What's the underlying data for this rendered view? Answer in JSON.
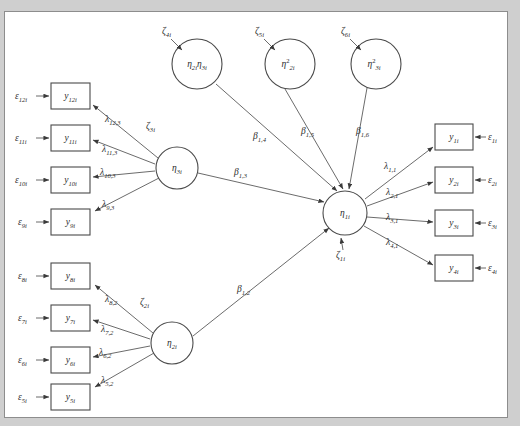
{
  "figure": {
    "type": "sem-path-diagram",
    "background_color": "#cfcfcf",
    "panel_color": "#ffffff",
    "border_color": "#8d8d8d",
    "line_color": "#5a5a5a"
  },
  "indicators_left": [
    {
      "id": "y12",
      "box_label": "y",
      "box_sub": "12i",
      "error_label": "ε",
      "error_sub": "12i",
      "loading_base": "λ",
      "loading_sub": "12,3"
    },
    {
      "id": "y11",
      "box_label": "y",
      "box_sub": "11i",
      "error_label": "ε",
      "error_sub": "11i",
      "loading_base": "λ",
      "loading_sub": "11,3"
    },
    {
      "id": "y10",
      "box_label": "y",
      "box_sub": "10i",
      "error_label": "ε",
      "error_sub": "10i",
      "loading_base": "λ",
      "loading_sub": "10,3"
    },
    {
      "id": "y9",
      "box_label": "y",
      "box_sub": "9i",
      "error_label": "ε",
      "error_sub": "9i",
      "loading_base": "λ",
      "loading_sub": "9,3"
    },
    {
      "id": "y8",
      "box_label": "y",
      "box_sub": "8i",
      "error_label": "ε",
      "error_sub": "8i",
      "loading_base": "λ",
      "loading_sub": "8,2"
    },
    {
      "id": "y7",
      "box_label": "y",
      "box_sub": "7i",
      "error_label": "ε",
      "error_sub": "7i",
      "loading_base": "λ",
      "loading_sub": "7,2"
    },
    {
      "id": "y6",
      "box_label": "y",
      "box_sub": "6i",
      "error_label": "ε",
      "error_sub": "6i",
      "loading_base": "λ",
      "loading_sub": "6,2"
    },
    {
      "id": "y5",
      "box_label": "y",
      "box_sub": "5i",
      "error_label": "ε",
      "error_sub": "5i",
      "loading_base": "λ",
      "loading_sub": "5,2"
    }
  ],
  "indicators_right": [
    {
      "id": "y1",
      "box_label": "y",
      "box_sub": "1i",
      "error_label": "ε",
      "error_sub": "1i",
      "loading_base": "λ",
      "loading_sub": "1,1"
    },
    {
      "id": "y2",
      "box_label": "y",
      "box_sub": "2i",
      "error_label": "ε",
      "error_sub": "2i",
      "loading_base": "λ",
      "loading_sub": "2,1"
    },
    {
      "id": "y3",
      "box_label": "y",
      "box_sub": "3i",
      "error_label": "ε",
      "error_sub": "3i",
      "loading_base": "λ",
      "loading_sub": "3,1"
    },
    {
      "id": "y4",
      "box_label": "y",
      "box_sub": "4i",
      "error_label": "ε",
      "error_sub": "4i",
      "loading_base": "λ",
      "loading_sub": "4,1"
    }
  ],
  "latents": {
    "eta1": {
      "base": "η",
      "sub": "1i",
      "disturbance_base": "ζ",
      "disturbance_sub": "1i"
    },
    "eta2": {
      "base": "η",
      "sub": "2i",
      "disturbance_base": "ζ",
      "disturbance_sub": "2i"
    },
    "eta3": {
      "base": "η",
      "sub": "3i",
      "disturbance_base": "ζ",
      "disturbance_sub": "3i"
    },
    "eta2eta3": {
      "base": "η",
      "sub": "2i",
      "base2": "η",
      "sub2": "3i",
      "disturbance_base": "ζ",
      "disturbance_sub": "4i"
    },
    "eta2sq": {
      "base": "η",
      "sup": "2",
      "sub": "2i",
      "disturbance_base": "ζ",
      "disturbance_sub": "5i"
    },
    "eta3sq": {
      "base": "η",
      "sup": "2",
      "sub": "3i",
      "disturbance_base": "ζ",
      "disturbance_sub": "6i"
    }
  },
  "structural_paths": [
    {
      "id": "b12",
      "base": "β",
      "sub": "1,2",
      "from": "eta2",
      "to": "eta1"
    },
    {
      "id": "b13",
      "base": "β",
      "sub": "1,3",
      "from": "eta3",
      "to": "eta1"
    },
    {
      "id": "b14",
      "base": "β",
      "sub": "1,4",
      "from": "eta2eta3",
      "to": "eta1"
    },
    {
      "id": "b15",
      "base": "β",
      "sub": "1,5",
      "from": "eta2sq",
      "to": "eta1"
    },
    {
      "id": "b16",
      "base": "β",
      "sub": "1,6",
      "from": "eta3sq",
      "to": "eta1"
    }
  ]
}
